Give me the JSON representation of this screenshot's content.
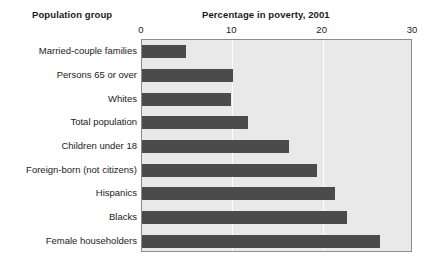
{
  "headers": {
    "group_header": "Population group",
    "chart_title": "Percentage in poverty, 2001"
  },
  "chart_data": {
    "type": "bar",
    "orientation": "horizontal",
    "title": "Percentage in poverty, 2001",
    "xlabel": "",
    "ylabel": "Population group",
    "xlim": [
      0,
      30
    ],
    "xticks": [
      0,
      10,
      20,
      30
    ],
    "xtick_labels": [
      "0",
      "10",
      "20",
      "30"
    ],
    "grid": true,
    "grid_axis": "x",
    "legend": false,
    "categories": [
      "Married-couple families",
      "Persons 65 or over",
      "Whites",
      "Total population",
      "Children under 18",
      "Foreign-born (not citizens)",
      "Hispanics",
      "Blacks",
      "Female householders"
    ],
    "values": [
      4.9,
      10.1,
      9.9,
      11.7,
      16.3,
      19.4,
      21.4,
      22.7,
      26.4
    ],
    "bar_color": "#4b4b4b",
    "plot_background": "#e9e9e9",
    "gridline_color": "#fdfdfd",
    "border_color": "#8b8b8b"
  }
}
